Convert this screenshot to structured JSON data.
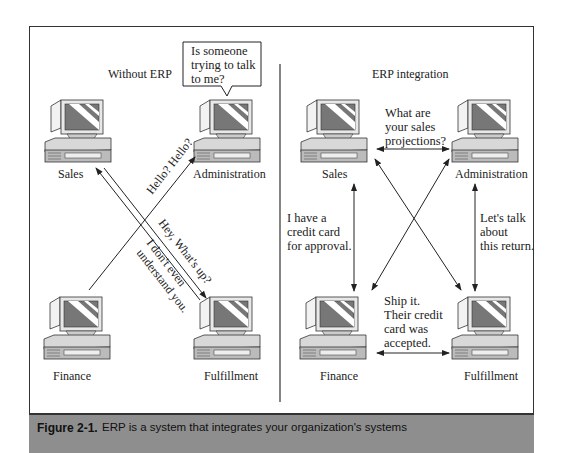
{
  "left_panel": {
    "title": "Without ERP",
    "nodes": [
      "Sales",
      "Administration",
      "Finance",
      "Fulfillment"
    ],
    "speech_bubble": [
      "Is someone",
      "trying to talk",
      "to me?"
    ],
    "messages": {
      "finance_to_admin": "Hello? Hello?",
      "sales_fulfillment_1": "Hey, What's up?",
      "sales_fulfillment_2": [
        "I don't even",
        "understand you."
      ]
    }
  },
  "right_panel": {
    "title": "ERP integration",
    "nodes": [
      "Sales",
      "Administration",
      "Finance",
      "Fulfillment"
    ],
    "messages": {
      "sales_admin": [
        "What are",
        "your sales",
        "projections?"
      ],
      "sales_finance": [
        "I have a",
        "credit card",
        "for approval."
      ],
      "admin_fulfillment": [
        "Let's talk",
        "about",
        "this return."
      ],
      "finance_fulfillment": [
        "Ship it.",
        "Their credit",
        "card was",
        "accepted."
      ]
    }
  },
  "caption": {
    "figure_label": "Figure 2-1.",
    "text": "ERP is a system that integrates your organization's systems"
  }
}
